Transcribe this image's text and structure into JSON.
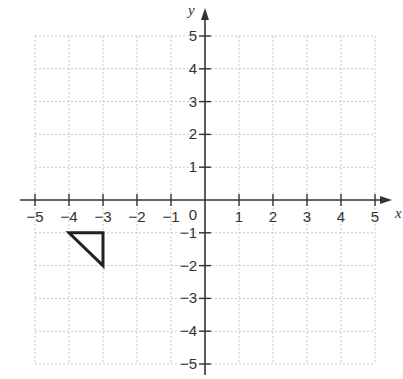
{
  "chart_data": {
    "type": "diagram",
    "title": "",
    "xlabel": "x",
    "ylabel": "y",
    "xlim": [
      -5,
      5
    ],
    "ylim": [
      -5,
      5
    ],
    "grid": true,
    "x_ticks": [
      "−5",
      "−4",
      "−3",
      "−2",
      "−1",
      "1",
      "2",
      "3",
      "4",
      "5"
    ],
    "y_ticks": [
      "5",
      "4",
      "3",
      "2",
      "1",
      "−1",
      "−2",
      "−3",
      "−4",
      "−5"
    ],
    "origin_label": "0",
    "shapes": [
      {
        "type": "triangle",
        "vertices": [
          [
            -4,
            -1
          ],
          [
            -3,
            -1
          ],
          [
            -3,
            -2
          ]
        ],
        "stroke": "#222222"
      }
    ]
  },
  "colors": {
    "grid": "#c8c8c8",
    "axis": "#333333",
    "shape": "#222222"
  }
}
